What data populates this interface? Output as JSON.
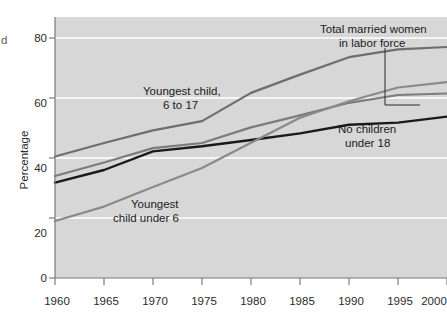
{
  "figure": {
    "plot_background": "#d7d7d7",
    "page_background": "#ffffff",
    "gridline_color": "#ffffff",
    "axis_color": "#7a7a7a",
    "clipped_left_text": "d"
  },
  "axes": {
    "y_label": "Percentage",
    "y_ticks": [
      "0",
      "20",
      "40",
      "60",
      "80"
    ],
    "x_ticks": [
      "1960",
      "1965",
      "1970",
      "1975",
      "1980",
      "1985",
      "1990",
      "1995",
      "2000"
    ]
  },
  "annotations": {
    "total_married": {
      "line1": "Total married women",
      "line2": "in labor force"
    },
    "youngest_6_to_17": {
      "line1": "Youngest child,",
      "line2": "6 to 17"
    },
    "youngest_under_6": {
      "line1": "Youngest",
      "line2": "child under 6"
    },
    "no_children": {
      "line1": "No children",
      "line2": "under 18"
    }
  },
  "chart_data": {
    "type": "line",
    "title": "",
    "xlabel": "",
    "ylabel": "Percentage",
    "xlim": [
      1960,
      2000
    ],
    "ylim": [
      0,
      86
    ],
    "grid": true,
    "gridlines_y": [
      20,
      40,
      60,
      80
    ],
    "legend_position": "inline-annotations",
    "x": [
      1960,
      1965,
      1970,
      1975,
      1980,
      1985,
      1990,
      1995,
      2000
    ],
    "series": [
      {
        "name": "Youngest child, 6 to 17",
        "label_key": "youngest_6_to_17",
        "color": "#6e6e6e",
        "width": 2.2,
        "values": [
          40.5,
          45.0,
          49.2,
          52.3,
          61.7,
          67.8,
          73.6,
          76.2,
          77.0
        ]
      },
      {
        "name": "Total married women in labor force",
        "label_key": "total_married",
        "color": "#7c7c7c",
        "width": 2.2,
        "values": [
          34.0,
          38.5,
          43.3,
          45.0,
          50.2,
          54.2,
          58.4,
          61.0,
          61.5
        ]
      },
      {
        "name": "No children under 18",
        "label_key": "no_children",
        "color": "#1a1a1a",
        "width": 2.4,
        "values": [
          31.8,
          36.0,
          42.2,
          43.9,
          46.0,
          48.2,
          51.1,
          51.8,
          53.8
        ]
      },
      {
        "name": "Youngest child under 6",
        "label_key": "youngest_under_6",
        "color": "#8a8a8a",
        "width": 2.2,
        "values": [
          19.0,
          23.8,
          30.3,
          36.7,
          45.1,
          53.4,
          58.9,
          63.5,
          65.3
        ]
      }
    ]
  }
}
